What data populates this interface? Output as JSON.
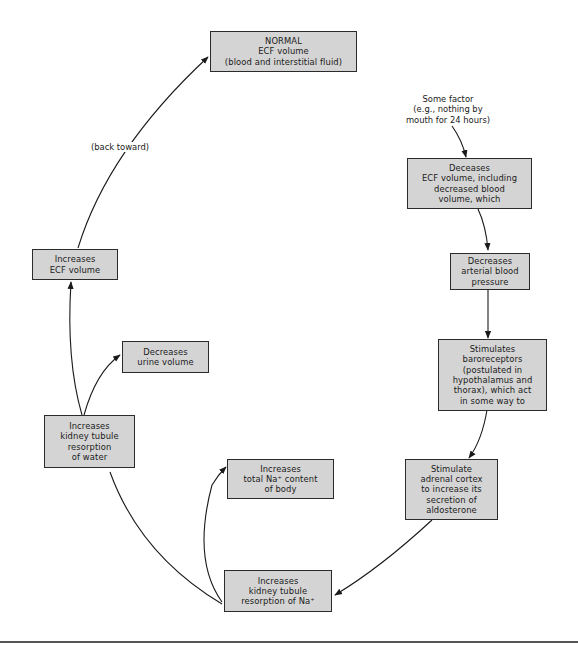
{
  "diagram": {
    "title": "NORMAL\nECF volume\n(blood and interstitial fluid)",
    "trigger_label": "Some factor\n(e.g., nothing by\nmouth for 24 hours)",
    "back_toward_label": "(back toward)",
    "nodes": [
      {
        "id": "normal",
        "text": "NORMAL\nECF volume\n(blood and interstitial fluid)"
      },
      {
        "id": "decreases-ecf",
        "text": "Deceases\nECF volume, including\ndecreased blood\nvolume, which"
      },
      {
        "id": "decreases-bp",
        "text": "Decreases\narterial blood\npressure"
      },
      {
        "id": "baroreceptors",
        "text": "Stimulates\nbaroreceptors\n(postulated in\nhypothalamus and\nthorax), which act\nin some way to"
      },
      {
        "id": "adrenal",
        "text": "Stimulate\nadrenal cortex\nto increase its\nsecretion of\naldosterone"
      },
      {
        "id": "na-resorption",
        "text": "Increases\nkidney tubule\nresorption of Na⁺"
      },
      {
        "id": "na-content",
        "text": "Increases\ntotal Na⁺ content\nof body"
      },
      {
        "id": "water-resorption",
        "text": "Increases\nkidney tubule\nresorption\nof water"
      },
      {
        "id": "urine",
        "text": "Decreases\nurine volume"
      },
      {
        "id": "increases-ecf",
        "text": "Increases\nECF volume"
      }
    ],
    "edges": [
      {
        "from": "trigger",
        "to": "decreases-ecf"
      },
      {
        "from": "decreases-ecf",
        "to": "decreases-bp"
      },
      {
        "from": "decreases-bp",
        "to": "baroreceptors"
      },
      {
        "from": "baroreceptors",
        "to": "adrenal"
      },
      {
        "from": "adrenal",
        "to": "na-resorption"
      },
      {
        "from": "na-resorption",
        "to": "na-content"
      },
      {
        "from": "na-resorption",
        "to": "water-resorption"
      },
      {
        "from": "water-resorption",
        "to": "urine"
      },
      {
        "from": "water-resorption",
        "to": "increases-ecf"
      },
      {
        "from": "increases-ecf",
        "to": "normal",
        "label": "(back toward)"
      }
    ],
    "colors": {
      "box_fill": "#d4d4d4",
      "box_border": "#2b2b2b",
      "line": "#1a1a1a",
      "background": "#ffffff"
    }
  }
}
